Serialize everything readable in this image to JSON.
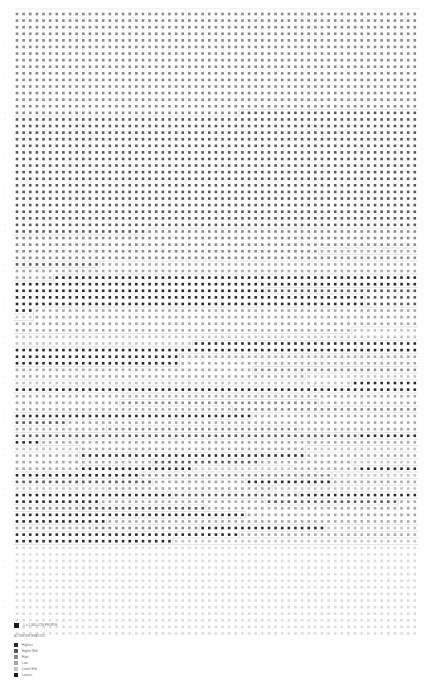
{
  "chart_data": {
    "type": "heatmap",
    "title": "",
    "top_label": "",
    "columns": 61,
    "rows": 91,
    "unit": "1 = 1 MILLION PEOPLE",
    "levels": [
      {
        "level": 6,
        "label": "Highest",
        "color": "#2a2a2a"
      },
      {
        "level": 5,
        "label": "Higher Mid",
        "color": "#5a5a5a"
      },
      {
        "level": 4,
        "label": "High",
        "color": "#8a8a8a"
      },
      {
        "level": 3,
        "label": "Low",
        "color": "#a9a9a9"
      },
      {
        "level": 2,
        "label": "Lower Mid",
        "color": "#c4c4c4"
      },
      {
        "level": 1,
        "label": "Lowest",
        "color": "#dcdcdc"
      }
    ],
    "row_runs": [
      [
        [
          0,
          4
        ]
      ],
      [
        [
          0,
          4
        ]
      ],
      [
        [
          0,
          4
        ]
      ],
      [
        [
          0,
          4
        ]
      ],
      [
        [
          0,
          4
        ]
      ],
      [
        [
          0,
          4
        ]
      ],
      [
        [
          0,
          4
        ]
      ],
      [
        [
          0,
          4
        ]
      ],
      [
        [
          0,
          4
        ]
      ],
      [
        [
          0,
          4
        ]
      ],
      [
        [
          0,
          4
        ]
      ],
      [
        [
          0,
          4
        ]
      ],
      [
        [
          0,
          4
        ]
      ],
      [
        [
          0,
          4
        ]
      ],
      [
        [
          0,
          4
        ]
      ],
      [
        [
          0,
          4
        ],
        [
          34,
          5
        ]
      ],
      [
        [
          0,
          5
        ]
      ],
      [
        [
          0,
          5
        ]
      ],
      [
        [
          0,
          5
        ]
      ],
      [
        [
          0,
          5
        ]
      ],
      [
        [
          0,
          5
        ]
      ],
      [
        [
          0,
          5
        ]
      ],
      [
        [
          0,
          5
        ]
      ],
      [
        [
          0,
          5
        ]
      ],
      [
        [
          0,
          5
        ]
      ],
      [
        [
          0,
          5
        ]
      ],
      [
        [
          0,
          5
        ]
      ],
      [
        [
          0,
          5
        ]
      ],
      [
        [
          0,
          5
        ]
      ],
      [
        [
          0,
          5
        ]
      ],
      [
        [
          0,
          5
        ]
      ],
      [
        [
          0,
          5
        ]
      ],
      [
        [
          0,
          5
        ]
      ],
      [
        [
          0,
          5
        ],
        [
          20,
          4
        ]
      ],
      [
        [
          0,
          4
        ]
      ],
      [
        [
          0,
          4
        ]
      ],
      [
        [
          0,
          4
        ],
        [
          46,
          3
        ]
      ],
      [
        [
          0,
          4
        ]
      ],
      [
        [
          0,
          5
        ],
        [
          13,
          3
        ]
      ],
      [
        [
          0,
          3
        ]
      ],
      [
        [
          0,
          3
        ],
        [
          6,
          6
        ]
      ],
      [
        [
          0,
          6
        ]
      ],
      [
        [
          0,
          6
        ],
        [
          38,
          5
        ]
      ],
      [
        [
          0,
          6
        ],
        [
          53,
          5
        ]
      ],
      [
        [
          0,
          6
        ],
        [
          53,
          5
        ]
      ],
      [
        [
          0,
          6
        ],
        [
          3,
          3
        ]
      ],
      [
        [
          0,
          2
        ],
        [
          3,
          3
        ]
      ],
      [
        [
          0,
          3
        ]
      ],
      [
        [
          0,
          3
        ],
        [
          51,
          2
        ]
      ],
      [
        [
          0,
          2
        ]
      ],
      [
        [
          0,
          2
        ],
        [
          27,
          6
        ]
      ],
      [
        [
          0,
          6
        ]
      ],
      [
        [
          0,
          6
        ],
        [
          10,
          6
        ],
        [
          25,
          3
        ]
      ],
      [
        [
          0,
          6
        ],
        [
          25,
          3
        ]
      ],
      [
        [
          0,
          3
        ],
        [
          36,
          4
        ]
      ],
      [
        [
          0,
          3
        ],
        [
          44,
          2
        ]
      ],
      [
        [
          0,
          2
        ],
        [
          51,
          6
        ]
      ],
      [
        [
          0,
          6
        ],
        [
          51,
          6
        ]
      ],
      [
        [
          0,
          3
        ],
        [
          9,
          3
        ]
      ],
      [
        [
          0,
          3
        ],
        [
          16,
          4
        ],
        [
          46,
          3
        ]
      ],
      [
        [
          0,
          3
        ],
        [
          33,
          4
        ]
      ],
      [
        [
          0,
          6
        ],
        [
          36,
          3
        ]
      ],
      [
        [
          0,
          5
        ],
        [
          8,
          3
        ]
      ],
      [
        [
          0,
          3
        ],
        [
          14,
          4
        ],
        [
          43,
          3
        ]
      ],
      [
        [
          0,
          5
        ],
        [
          21,
          5
        ],
        [
          52,
          6
        ]
      ],
      [
        [
          0,
          6
        ],
        [
          4,
          3
        ],
        [
          40,
          3
        ]
      ],
      [
        [
          0,
          2
        ],
        [
          10,
          3
        ],
        [
          44,
          2
        ]
      ],
      [
        [
          0,
          3
        ],
        [
          10,
          6
        ],
        [
          44,
          3
        ]
      ],
      [
        [
          0,
          3
        ],
        [
          21,
          5
        ],
        [
          37,
          3
        ],
        [
          51,
          2
        ]
      ],
      [
        [
          0,
          3
        ],
        [
          10,
          6
        ],
        [
          27,
          2
        ],
        [
          42,
          3
        ],
        [
          52,
          6
        ]
      ],
      [
        [
          0,
          6
        ],
        [
          19,
          4
        ],
        [
          48,
          2
        ]
      ],
      [
        [
          0,
          5
        ],
        [
          21,
          3
        ],
        [
          35,
          6
        ],
        [
          48,
          3
        ]
      ],
      [
        [
          0,
          2
        ],
        [
          14,
          3
        ],
        [
          39,
          2
        ]
      ],
      [
        [
          0,
          6
        ],
        [
          24,
          5
        ],
        [
          43,
          6
        ]
      ],
      [
        [
          0,
          6
        ],
        [
          13,
          3
        ],
        [
          38,
          5
        ],
        [
          58,
          3
        ]
      ],
      [
        [
          0,
          4
        ],
        [
          10,
          5
        ],
        [
          29,
          3
        ]
      ],
      [
        [
          0,
          6
        ],
        [
          12,
          6
        ],
        [
          26,
          6
        ],
        [
          35,
          3
        ]
      ],
      [
        [
          0,
          6
        ],
        [
          14,
          3
        ]
      ],
      [
        [
          0,
          3
        ],
        [
          12,
          4
        ],
        [
          28,
          6
        ],
        [
          47,
          2
        ]
      ],
      [
        [
          0,
          6
        ],
        [
          11,
          6
        ],
        [
          34,
          3
        ]
      ],
      [
        [
          0,
          6
        ],
        [
          14,
          6
        ],
        [
          24,
          2
        ]
      ],
      [
        [
          0,
          1
        ]
      ],
      [
        [
          0,
          1
        ]
      ],
      [
        [
          0,
          1
        ]
      ],
      [
        [
          0,
          1
        ]
      ],
      [
        [
          0,
          1
        ]
      ],
      [
        [
          0,
          1
        ]
      ],
      [
        [
          0,
          1
        ]
      ],
      [
        [
          0,
          1
        ]
      ],
      [
        [
          0,
          1
        ]
      ],
      [
        [
          0,
          1
        ]
      ],
      [
        [
          0,
          1
        ]
      ],
      [
        [
          0,
          1
        ]
      ],
      [
        [
          0,
          1
        ]
      ],
      [
        [
          0,
          1
        ]
      ]
    ]
  },
  "legend": {
    "scale_label": "1 = 1 MILLION PEOPLE",
    "heading": "ALTIMETER READING",
    "items": [
      {
        "label": "Highest",
        "color": "#2a2a2a"
      },
      {
        "label": "Higher Mid",
        "color": "#5a5a5a"
      },
      {
        "label": "High",
        "color": "#8a8a8a"
      },
      {
        "label": "Low",
        "color": "#a9a9a9"
      },
      {
        "label": "Lower Mid",
        "color": "#c4c4c4"
      },
      {
        "label": "Lowest",
        "color": "#1a1a1a"
      }
    ]
  }
}
